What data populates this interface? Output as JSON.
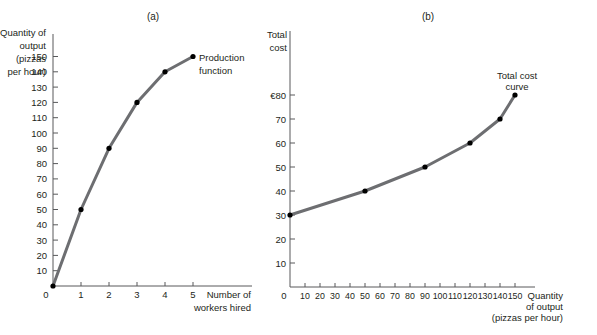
{
  "chart_data": [
    {
      "panel_label": "(a)",
      "type": "line",
      "title": "",
      "xlabel": "Number of workers hired",
      "ylabel": "Quantity of output (pizzas per hour)",
      "x": [
        0,
        1,
        2,
        3,
        4,
        5
      ],
      "series": [
        {
          "name": "Production function",
          "values": [
            0,
            50,
            90,
            120,
            140,
            150
          ]
        }
      ],
      "xticks": [
        0,
        1,
        2,
        3,
        4,
        5
      ],
      "yticks": [
        10,
        20,
        30,
        40,
        50,
        60,
        70,
        80,
        90,
        100,
        110,
        120,
        130,
        140,
        150
      ],
      "xlim": [
        0,
        5
      ],
      "ylim": [
        0,
        150
      ],
      "grid": false,
      "annotation": "Production function"
    },
    {
      "panel_label": "(b)",
      "type": "line",
      "title": "",
      "xlabel": "Quantity of output (pizzas per hour)",
      "ylabel": "Total cost",
      "x": [
        0,
        50,
        90,
        120,
        140,
        150
      ],
      "series": [
        {
          "name": "Total cost curve",
          "values": [
            30,
            40,
            50,
            60,
            70,
            80
          ]
        }
      ],
      "xticks": [
        10,
        20,
        30,
        40,
        50,
        60,
        70,
        80,
        90,
        100,
        110,
        120,
        130,
        140,
        150
      ],
      "yticks": [
        10,
        20,
        30,
        40,
        50,
        60,
        70,
        "€80"
      ],
      "xlim": [
        0,
        150
      ],
      "ylim": [
        0,
        80
      ],
      "grid": false,
      "annotation": "Total cost curve"
    }
  ],
  "panel_a": {
    "label": "(a)",
    "ylabel_lines": [
      "Quantity of",
      "output",
      "(pizzas",
      "per hour)"
    ],
    "xlabel_lines": [
      "Number of",
      "workers hired"
    ],
    "origin_label": "0",
    "annotation_lines": [
      "Production",
      "function"
    ]
  },
  "panel_b": {
    "label": "(b)",
    "ylabel_lines": [
      "Total",
      "cost"
    ],
    "xlabel_lines": [
      "Quantity",
      "of output",
      "(pizzas per hour)"
    ],
    "origin_label": "0",
    "annotation_lines": [
      "Total cost",
      "curve"
    ]
  },
  "colors": {
    "line": "#6d6e71",
    "point": "#000000",
    "axis": "#58595b",
    "text": "#231f20"
  }
}
